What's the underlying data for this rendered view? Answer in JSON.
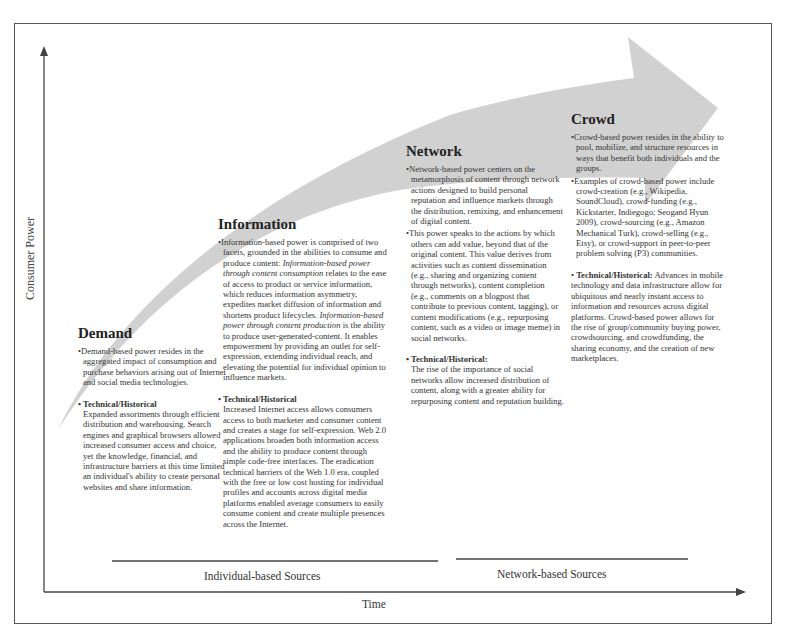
{
  "axes": {
    "y_label": "Consumer Power",
    "x_label": "Time"
  },
  "source_groups": [
    {
      "label": "Individual-based Sources"
    },
    {
      "label": "Network-based Sources"
    }
  ],
  "stages": [
    {
      "title": "Demand",
      "bullets": [
        "Demand-based power resides in the aggregated impact of consumption and purchase behaviors arising out of Internet and social media technologies."
      ],
      "technical_heading": "Technical/Historical",
      "technical_text": "Expanded assortments through efficient distribution and warehousing. Search engines and graphical browsers allowed increased consumer access and choice, yet the knowledge, financial, and infrastructure barriers at this time limited an individual's ability to create personal websites and share information."
    },
    {
      "title": "Information",
      "bullets": [
        {
          "p1": "Information-based power is comprised of two facets, grounded in the abilities to consume and produce content: ",
          "i1": "Information-based power through content consumption",
          "p2": " relates to the ease of access to product or service information, which reduces information asymmetry, expedites market diffusion of information and shortens product lifecycles. ",
          "i2": "Information-based power through content production",
          "p3": " is the ability to produce user-generated-content. It enables empowerment by providing an outlet for self-expression, extending individual reach, and elevating the potential for individual opinion to influence markets."
        }
      ],
      "technical_heading": "Technical/Historical",
      "technical_text": "Increased Internet access allows consumers access to both marketer and consumer content and creates a stage for self-expression. Web 2.0 applications broaden both information access and the ability to produce content through simple code-free interfaces. The eradication technical barriers of the Web 1.0 era, coupled with the free or low cost hosting for individual profiles and accounts across digital media platforms enabled average consumers to easily consume content and create multiple presences across the Internet."
    },
    {
      "title": "Network",
      "bullets": [
        "Network-based power centers on the metamorphosis of content through network actions designed to build personal reputation and influence markets through the distribution, remixing, and enhancement of digital content.",
        "This power speaks to the actions by which others can add value, beyond that of the original content. This value derives from activities such as content dissemination (e.g., sharing and organizing content through networks), content completion (e.g., comments on a blogpost that contribute to previous content, tagging), or content modifications (e.g., repurposing content, such as a video or image meme) in social networks."
      ],
      "technical_heading": "Technical/Historical:",
      "technical_text": "The rise of the importance of social networks allow increased distribution of content, along with a greater ability for repurposing content and reputation building."
    },
    {
      "title": "Crowd",
      "bullets": [
        "Crowd-based power resides in the ability to pool, mobilize, and structure resources in ways that benefit both individuals and the groups.",
        "Examples of crowd-based power include crowd-creation (e.g., Wikipedia, SoundCloud), crowd-funding (e.g., Kickstarter, Indiegogo; Seogand Hyun 2009), crowd-sourcing (e.g., Amazon Mechanical Turk), crowd-selling (e.g., Etsy), or crowd-support in peer-to-peer problem solving (P3) communities."
      ],
      "technical_heading": "Technical/Historical:",
      "technical_text": " Advances in mobile technology and data infrastructure allow for ubiquitous and nearly instant access to information and resources across digital platforms. Crowd-based power allows for the rise of group/community buying power, crowdsourcing, and crowdfunding, the sharing economy, and the creation of new marketplaces."
    }
  ],
  "colors": {
    "arrow_fill": "#cfcfcf",
    "axis": "#444444",
    "frame": "#555555",
    "text": "#2a2a2a"
  }
}
